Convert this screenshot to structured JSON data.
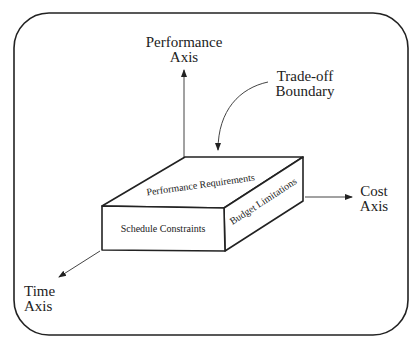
{
  "diagram": {
    "axes": {
      "performance": [
        "Performance",
        "Axis"
      ],
      "cost": [
        "Cost",
        "Axis"
      ],
      "time": [
        "Time",
        "Axis"
      ]
    },
    "callout": [
      "Trade-off",
      "Boundary"
    ],
    "box_faces": {
      "top": "Performance Requirements",
      "front": "Schedule Constraints",
      "side": "Budget Limitations"
    }
  }
}
